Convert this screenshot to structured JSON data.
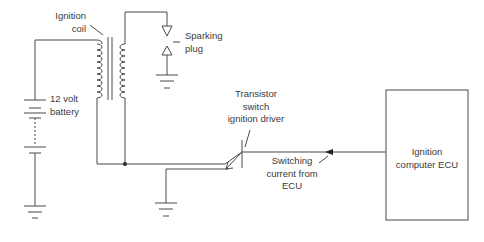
{
  "diagram": {
    "type": "circuit-schematic",
    "colors": {
      "line": "#4a4a4a",
      "text": "#3a3a3a",
      "background": "#ffffff"
    },
    "labels": {
      "ignition_coil": [
        "Ignition",
        "coil"
      ],
      "sparking_plug": [
        "Sparking",
        "plug"
      ],
      "battery": [
        "12 volt",
        "battery"
      ],
      "transistor": [
        "Transistor",
        "switch",
        "ignition driver"
      ],
      "switching_current": [
        "Switching",
        "current from",
        "ECU"
      ],
      "ecu": [
        "Ignition",
        "computer ECU"
      ]
    },
    "components": [
      "12 volt battery",
      "ignition coil (primary + secondary windings, iron core)",
      "sparking plug",
      "transistor switch (ignition driver)",
      "ignition computer ECU",
      "ground symbols (3)"
    ]
  }
}
